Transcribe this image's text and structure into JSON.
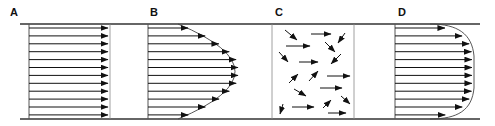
{
  "diagram": {
    "colors": {
      "line": "#333333",
      "arrow": "#111111",
      "wall": "#555555",
      "curve": "#444444"
    },
    "pipe": {
      "top_y": 24,
      "bottom_y": 119,
      "left_x": 20,
      "right_x": 480
    },
    "panels": [
      {
        "id": "A",
        "label": "A",
        "type": "uniform",
        "wall_left": 29,
        "wall_right": 110,
        "profile": "plug flow (uniform velocity)"
      },
      {
        "id": "B",
        "label": "B",
        "type": "parabolic",
        "wall_left": 148,
        "apex_x": 240,
        "profile": "laminar flow (parabolic)"
      },
      {
        "id": "C",
        "label": "C",
        "type": "random",
        "wall_left": 272,
        "wall_right": 354,
        "profile": "turbulent (random motion)"
      },
      {
        "id": "D",
        "label": "D",
        "type": "blunt",
        "wall_left": 395,
        "apex_x": 472,
        "profile": "turbulent flow (blunt profile)"
      }
    ]
  }
}
